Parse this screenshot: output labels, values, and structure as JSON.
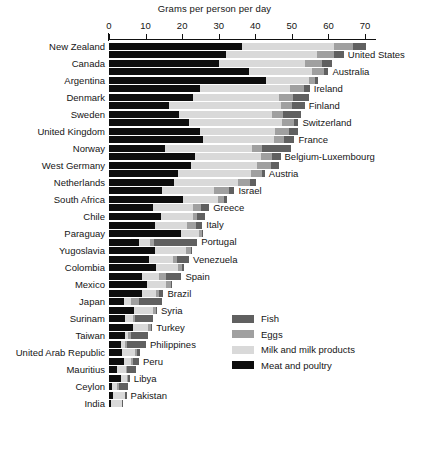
{
  "chart_data": {
    "type": "bar",
    "orientation": "horizontal",
    "stacked": true,
    "title": "Grams per person per day",
    "xlabel": "Grams per person per day",
    "ylabel": "",
    "xlim": [
      0,
      73
    ],
    "ticks": [
      0,
      10,
      20,
      30,
      40,
      50,
      60,
      70
    ],
    "grid": false,
    "legend_position": "inside-right",
    "series": [
      {
        "name": "Meat and poultry",
        "color": "#0d0d0d"
      },
      {
        "name": "Milk and milk products",
        "color": "#d9d9d9"
      },
      {
        "name": "Eggs",
        "color": "#a0a0a0"
      },
      {
        "name": "Fish",
        "color": "#606060"
      }
    ],
    "categories": [
      "New Zealand",
      "United States",
      "Canada",
      "Australia",
      "Argentina",
      "Ireland",
      "Denmark",
      "Finland",
      "Sweden",
      "Switzerland",
      "United Kingdom",
      "France",
      "Norway",
      "Belgium-Luxembourg",
      "West Germany",
      "Austria",
      "Netherlands",
      "Israel",
      "South Africa",
      "Greece",
      "Chile",
      "Italy",
      "Paraguay",
      "Portugal",
      "Yugoslavia",
      "Venezuela",
      "Colombia",
      "Mexico",
      "Spain",
      "Brazil",
      "Japan",
      "Syria",
      "Surinam",
      "Turkey",
      "Taiwan",
      "Philippines",
      "United Arab Republic",
      "Peru",
      "Mauritius",
      "Libya",
      "Ceylon",
      "Pakistan",
      "India"
    ],
    "label_side": [
      "left",
      "right",
      "left",
      "right",
      "left",
      "right",
      "left",
      "right",
      "left",
      "right",
      "left",
      "right",
      "left",
      "right",
      "left",
      "right",
      "left",
      "right",
      "left",
      "right",
      "left",
      "right",
      "left",
      "right",
      "left",
      "right",
      "left",
      "right",
      "left",
      "right",
      "left",
      "right",
      "left",
      "right",
      "left",
      "right",
      "left",
      "right",
      "left",
      "right",
      "left",
      "right",
      "left"
    ],
    "rows": [
      {
        "label": "New Zealand",
        "meat": 36.3,
        "milk": 25.3,
        "eggs": 5.2,
        "fish": 3.4,
        "total": 70.2
      },
      {
        "label": "United States",
        "meat": 32.1,
        "milk": 24.8,
        "eggs": 4.7,
        "fish": 2.6,
        "total": 64.2
      },
      {
        "label": "Canada",
        "meat": 30.0,
        "milk": 23.5,
        "eggs": 4.8,
        "fish": 2.6,
        "total": 60.9
      },
      {
        "label": "Australia",
        "meat": 38.2,
        "milk": 17.4,
        "eggs": 3.2,
        "fish": 1.2,
        "total": 60.0
      },
      {
        "label": "Argentina",
        "meat": 42.8,
        "milk": 12.0,
        "eggs": 1.6,
        "fish": 0.7,
        "total": 57.1
      },
      {
        "label": "Ireland",
        "meat": 24.8,
        "milk": 24.8,
        "eggs": 3.7,
        "fish": 1.6,
        "total": 54.9
      },
      {
        "label": "Denmark",
        "meat": 23.0,
        "milk": 23.4,
        "eggs": 3.8,
        "fish": 4.5,
        "total": 54.7
      },
      {
        "label": "Finland",
        "meat": 16.3,
        "milk": 30.8,
        "eggs": 3.0,
        "fish": 3.4,
        "total": 53.5
      },
      {
        "label": "Sweden",
        "meat": 19.2,
        "milk": 25.5,
        "eggs": 3.0,
        "fish": 4.7,
        "total": 52.4
      },
      {
        "label": "Switzerland",
        "meat": 21.8,
        "milk": 25.4,
        "eggs": 3.3,
        "fish": 1.3,
        "total": 51.8
      },
      {
        "label": "United Kingdom",
        "meat": 24.9,
        "milk": 20.6,
        "eggs": 3.8,
        "fish": 2.5,
        "total": 51.8
      },
      {
        "label": "France",
        "meat": 25.7,
        "milk": 19.4,
        "eggs": 2.8,
        "fish": 2.8,
        "total": 50.7
      },
      {
        "label": "Norway",
        "meat": 15.4,
        "milk": 23.8,
        "eggs": 2.6,
        "fish": 8.0,
        "total": 49.8
      },
      {
        "label": "Belgium-Luxembourg",
        "meat": 23.6,
        "milk": 18.0,
        "eggs": 3.1,
        "fish": 2.2,
        "total": 46.9
      },
      {
        "label": "West Germany",
        "meat": 22.4,
        "milk": 18.0,
        "eggs": 3.8,
        "fish": 2.2,
        "total": 46.4
      },
      {
        "label": "Austria",
        "meat": 19.0,
        "milk": 19.8,
        "eggs": 3.0,
        "fish": 0.8,
        "total": 42.6
      },
      {
        "label": "Netherlands",
        "meat": 17.8,
        "milk": 17.6,
        "eggs": 3.2,
        "fish": 1.5,
        "total": 40.1
      },
      {
        "label": "Israel",
        "meat": 14.6,
        "milk": 14.2,
        "eggs": 4.0,
        "fish": 1.5,
        "total": 34.3
      },
      {
        "label": "South Africa",
        "meat": 20.3,
        "milk": 9.6,
        "eggs": 1.5,
        "fish": 1.0,
        "total": 32.4
      },
      {
        "label": "Greece",
        "meat": 12.0,
        "milk": 11.0,
        "eggs": 2.2,
        "fish": 2.2,
        "total": 27.4
      },
      {
        "label": "Chile",
        "meat": 14.3,
        "milk": 8.6,
        "eggs": 1.2,
        "fish": 2.2,
        "total": 26.3
      },
      {
        "label": "Italy",
        "meat": 12.5,
        "milk": 8.9,
        "eggs": 2.5,
        "fish": 1.6,
        "total": 25.5
      },
      {
        "label": "Paraguay",
        "meat": 19.6,
        "milk": 5.0,
        "eggs": 0.8,
        "fish": 0.2,
        "total": 25.6
      },
      {
        "label": "Portugal",
        "meat": 8.1,
        "milk": 3.2,
        "eggs": 1.0,
        "fish": 11.8,
        "total": 24.1
      },
      {
        "label": "Yugoslavia",
        "meat": 12.7,
        "milk": 8.3,
        "eggs": 1.5,
        "fish": 0.3,
        "total": 22.8
      },
      {
        "label": "Venezuela",
        "meat": 11.0,
        "milk": 6.4,
        "eggs": 1.1,
        "fish": 3.4,
        "total": 21.9
      },
      {
        "label": "Colombia",
        "meat": 12.8,
        "milk": 6.0,
        "eggs": 1.1,
        "fish": 0.5,
        "total": 20.4
      },
      {
        "label": "Spain",
        "meat": 9.0,
        "milk": 4.6,
        "eggs": 2.0,
        "fish": 4.2,
        "total": 19.8
      },
      {
        "label": "Mexico",
        "meat": 10.5,
        "milk": 5.0,
        "eggs": 1.4,
        "fish": 0.3,
        "total": 17.2
      },
      {
        "label": "Brazil",
        "meat": 9.0,
        "milk": 3.8,
        "eggs": 0.8,
        "fish": 1.3,
        "total": 14.9
      },
      {
        "label": "Japan",
        "meat": 4.0,
        "milk": 2.0,
        "eggs": 2.3,
        "fish": 6.1,
        "total": 14.4
      },
      {
        "label": "Syria",
        "meat": 6.9,
        "milk": 5.2,
        "eggs": 0.8,
        "fish": 0.2,
        "total": 13.1
      },
      {
        "label": "Surinam",
        "meat": 4.5,
        "milk": 2.0,
        "eggs": 0.5,
        "fish": 5.0,
        "total": 12.0
      },
      {
        "label": "Turkey",
        "meat": 6.6,
        "milk": 4.0,
        "eggs": 0.9,
        "fish": 0.3,
        "total": 11.8
      },
      {
        "label": "Taiwan",
        "meat": 4.4,
        "milk": 0.9,
        "eggs": 0.7,
        "fish": 4.6,
        "total": 10.6
      },
      {
        "label": "Philippines",
        "meat": 3.2,
        "milk": 1.1,
        "eggs": 0.5,
        "fish": 5.3,
        "total": 10.1
      },
      {
        "label": "United Arab Republic",
        "meat": 3.6,
        "milk": 3.5,
        "eggs": 0.5,
        "fish": 1.0,
        "total": 8.6
      },
      {
        "label": "Peru",
        "meat": 4.0,
        "milk": 2.0,
        "eggs": 0.6,
        "fish": 1.6,
        "total": 8.2
      },
      {
        "label": "Mauritius",
        "meat": 2.1,
        "milk": 2.6,
        "eggs": 0.3,
        "fish": 2.4,
        "total": 7.4
      },
      {
        "label": "Libya",
        "meat": 3.3,
        "milk": 1.5,
        "eggs": 0.3,
        "fish": 0.6,
        "total": 5.7
      },
      {
        "label": "Ceylon",
        "meat": 0.8,
        "milk": 1.5,
        "eggs": 0.3,
        "fish": 2.6,
        "total": 5.2
      },
      {
        "label": "Pakistan",
        "meat": 1.0,
        "milk": 3.3,
        "eggs": 0.2,
        "fish": 0.3,
        "total": 4.8
      },
      {
        "label": "India",
        "meat": 0.5,
        "milk": 3.0,
        "eggs": 0.1,
        "fish": 0.2,
        "total": 3.8
      }
    ]
  },
  "legend": {
    "items": [
      {
        "label": "Fish",
        "color": "#606060"
      },
      {
        "label": "Eggs",
        "color": "#a0a0a0"
      },
      {
        "label": "Milk and milk products",
        "color": "#d9d9d9"
      },
      {
        "label": "Meat and poultry",
        "color": "#0d0d0d"
      }
    ]
  }
}
